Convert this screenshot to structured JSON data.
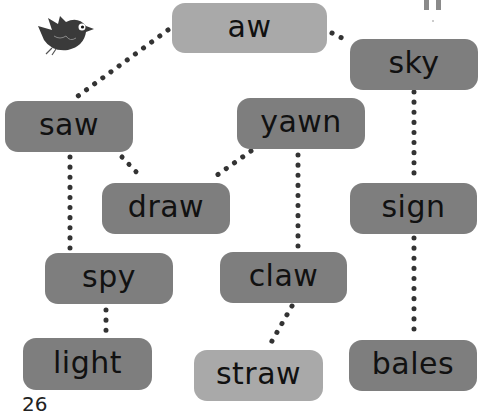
{
  "diagram": {
    "type": "word-tree",
    "page_number": "26",
    "colors": {
      "dark_box": "#7e7e7e",
      "light_box": "#a9a9a9",
      "dots": "#333333",
      "text": "#111111"
    },
    "nodes": [
      {
        "id": "aw",
        "label": "aw",
        "style": "light"
      },
      {
        "id": "sky",
        "label": "sky",
        "style": "dark"
      },
      {
        "id": "saw",
        "label": "saw",
        "style": "dark"
      },
      {
        "id": "yawn",
        "label": "yawn",
        "style": "dark"
      },
      {
        "id": "draw",
        "label": "draw",
        "style": "dark"
      },
      {
        "id": "sign",
        "label": "sign",
        "style": "dark"
      },
      {
        "id": "spy",
        "label": "spy",
        "style": "dark"
      },
      {
        "id": "claw",
        "label": "claw",
        "style": "dark"
      },
      {
        "id": "light",
        "label": "light",
        "style": "dark"
      },
      {
        "id": "straw",
        "label": "straw",
        "style": "light"
      },
      {
        "id": "bales",
        "label": "bales",
        "style": "dark"
      }
    ],
    "edges": [
      [
        "aw",
        "saw"
      ],
      [
        "aw",
        "sky"
      ],
      [
        "saw",
        "draw"
      ],
      [
        "saw",
        "spy"
      ],
      [
        "yawn",
        "draw"
      ],
      [
        "yawn",
        "claw"
      ],
      [
        "sky",
        "sign"
      ],
      [
        "sign",
        "bales"
      ],
      [
        "spy",
        "light"
      ],
      [
        "claw",
        "straw"
      ]
    ],
    "decorations": [
      "bird-icon",
      "legs-icon"
    ]
  }
}
